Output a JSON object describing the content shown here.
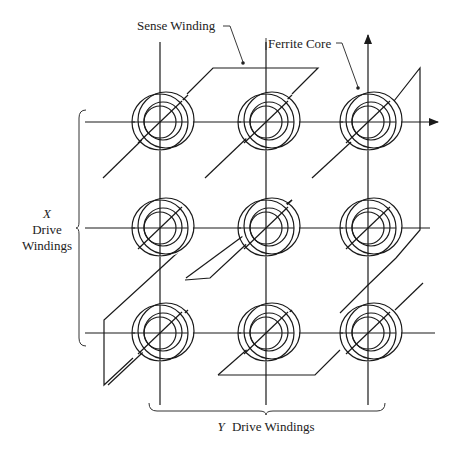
{
  "diagram": {
    "labels": {
      "sense_winding": "Sense Winding",
      "ferrite_core": "Ferrite Core",
      "x_drive_var": "X",
      "x_drive_line1": "Drive",
      "x_drive_line2": "Windings",
      "y_drive_var": "Y",
      "y_drive_text": "Drive Windings"
    },
    "grid": {
      "rows": 3,
      "columns": 3
    },
    "colors": {
      "line": "#1a1a1a",
      "background": "#ffffff",
      "text": "#222222"
    }
  }
}
